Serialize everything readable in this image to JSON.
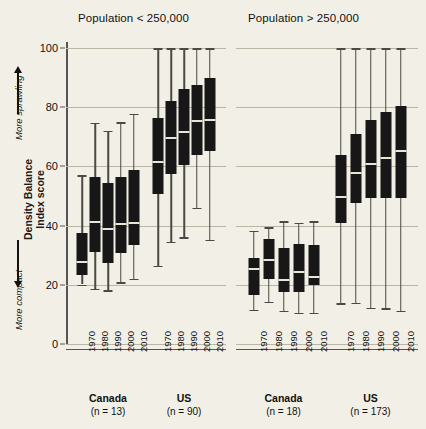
{
  "figure": {
    "background": "#f2f0e6",
    "ink": "#171717"
  },
  "panels": [
    {
      "title": "Population < 250,000"
    },
    {
      "title": "Population > 250,000"
    }
  ],
  "y_axis": {
    "label_main_line1": "Density Balance",
    "label_main_line2": "Index score",
    "label_high": "More sprawling",
    "label_low": "More compact",
    "ticks": [
      "0",
      "20",
      "40",
      "60",
      "80",
      "100"
    ],
    "min": 0,
    "max": 100
  },
  "x_axis": {
    "tick_labels": [
      "1970",
      "1980",
      "1990",
      "2000",
      "2010"
    ],
    "groups": [
      {
        "label": "Canada",
        "n": "(n = 13)"
      },
      {
        "label": "US",
        "n": "(n = 90)"
      },
      {
        "label": "Canada",
        "n": "(n = 18)"
      },
      {
        "label": "US",
        "n": "(n = 173)"
      }
    ]
  },
  "chart_data": {
    "type": "box",
    "xlabel": "",
    "ylabel": "Density Balance Index score",
    "ylim": [
      0,
      100
    ],
    "yticks": [
      0,
      20,
      40,
      60,
      80,
      100
    ],
    "grid": "horizontal",
    "legend": "none",
    "annotations": [
      "More sprawling",
      "More compact"
    ],
    "panels": [
      {
        "title": "Population < 250,000",
        "groups": [
          {
            "name": "Canada",
            "n": 13,
            "boxes": [
              {
                "category": "1970",
                "whisker_low": 20.1,
                "q1": 23.3,
                "median": 27.8,
                "q3": 37.5,
                "whisker_high": 57.0
              },
              {
                "category": "1980",
                "whisker_low": 18.6,
                "q1": 31.0,
                "median": 41.2,
                "q3": 56.4,
                "whisker_high": 74.7
              },
              {
                "category": "1990",
                "whisker_low": 18.2,
                "q1": 27.5,
                "median": 39.0,
                "q3": 54.3,
                "whisker_high": 72.0
              },
              {
                "category": "2000",
                "whisker_low": 20.8,
                "q1": 30.8,
                "median": 40.6,
                "q3": 56.3,
                "whisker_high": 75.0
              },
              {
                "category": "2010",
                "whisker_low": 22.0,
                "q1": 33.4,
                "median": 40.8,
                "q3": 58.9,
                "whisker_high": 77.8
              }
            ]
          },
          {
            "name": "US",
            "n": 90,
            "boxes": [
              {
                "category": "1970",
                "whisker_low": 26.4,
                "q1": 50.6,
                "median": 61.5,
                "q3": 76.3,
                "whisker_high": 100.0
              },
              {
                "category": "1980",
                "whisker_low": 34.6,
                "q1": 57.4,
                "median": 69.7,
                "q3": 82.2,
                "whisker_high": 100.0
              },
              {
                "category": "1990",
                "whisker_low": 36.0,
                "q1": 60.6,
                "median": 71.7,
                "q3": 86.0,
                "whisker_high": 100.0
              },
              {
                "category": "2000",
                "whisker_low": 46.0,
                "q1": 64.0,
                "median": 75.2,
                "q3": 87.6,
                "whisker_high": 100.0
              },
              {
                "category": "2010",
                "whisker_low": 35.3,
                "q1": 65.3,
                "median": 75.6,
                "q3": 90.0,
                "whisker_high": 100.0
              }
            ]
          }
        ]
      },
      {
        "title": "Population > 250,000",
        "groups": [
          {
            "name": "Canada",
            "n": 18,
            "boxes": [
              {
                "category": "1970",
                "whisker_low": 11.6,
                "q1": 16.7,
                "median": 25.3,
                "q3": 29.2,
                "whisker_high": 38.2
              },
              {
                "category": "1980",
                "whisker_low": 14.2,
                "q1": 21.8,
                "median": 28.5,
                "q3": 35.5,
                "whisker_high": 39.4
              },
              {
                "category": "1990",
                "whisker_low": 11.3,
                "q1": 17.5,
                "median": 21.6,
                "q3": 32.6,
                "whisker_high": 41.4
              },
              {
                "category": "2000",
                "whisker_low": 10.6,
                "q1": 17.7,
                "median": 24.4,
                "q3": 33.8,
                "whisker_high": 41.0
              },
              {
                "category": "2010",
                "whisker_low": 10.6,
                "q1": 19.9,
                "median": 22.7,
                "q3": 33.6,
                "whisker_high": 41.5
              }
            ]
          },
          {
            "name": "US",
            "n": 173,
            "boxes": [
              {
                "category": "1970",
                "whisker_low": 13.7,
                "q1": 41.0,
                "median": 49.6,
                "q3": 63.8,
                "whisker_high": 100.0
              },
              {
                "category": "1980",
                "whisker_low": 13.9,
                "q1": 47.8,
                "median": 57.8,
                "q3": 71.0,
                "whisker_high": 100.0
              },
              {
                "category": "1990",
                "whisker_low": 12.3,
                "q1": 49.4,
                "median": 60.8,
                "q3": 75.8,
                "whisker_high": 100.0
              },
              {
                "category": "2000",
                "whisker_low": 12.0,
                "q1": 49.2,
                "median": 63.0,
                "q3": 78.3,
                "whisker_high": 100.0
              },
              {
                "category": "2010",
                "whisker_low": 11.3,
                "q1": 49.3,
                "median": 65.2,
                "q3": 80.5,
                "whisker_high": 100.0
              }
            ]
          }
        ]
      }
    ]
  }
}
